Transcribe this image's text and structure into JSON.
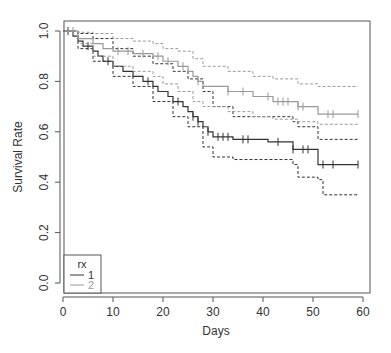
{
  "chart_data": {
    "type": "line",
    "subtype": "kaplan-meier",
    "title": "",
    "xlabel": "Days",
    "ylabel": "Survival Rate",
    "xlim": [
      0,
      60
    ],
    "ylim": [
      0,
      1
    ],
    "xticks": [
      0,
      10,
      20,
      30,
      40,
      50,
      60
    ],
    "xtick_labels": [
      "0",
      "10",
      "20",
      "30",
      "40",
      "50",
      "60"
    ],
    "yticks": [
      0.0,
      0.2,
      0.4,
      0.6,
      0.8,
      1.0
    ],
    "ytick_labels": [
      "0.0",
      "0.2",
      "0.4",
      "0.6",
      "0.8",
      "1.0"
    ],
    "grid": false,
    "legend": {
      "title": "rx",
      "position": "bottom-left",
      "entries": [
        "1",
        "2"
      ]
    },
    "series": [
      {
        "name": "1",
        "color": "#333333",
        "steps": [
          [
            0,
            1.0
          ],
          [
            2,
            0.98
          ],
          [
            3,
            0.96
          ],
          [
            4,
            0.94
          ],
          [
            6,
            0.92
          ],
          [
            7,
            0.9
          ],
          [
            8,
            0.88
          ],
          [
            10,
            0.86
          ],
          [
            12,
            0.84
          ],
          [
            14,
            0.82
          ],
          [
            16,
            0.8
          ],
          [
            18,
            0.78
          ],
          [
            19,
            0.76
          ],
          [
            21,
            0.74
          ],
          [
            22,
            0.72
          ],
          [
            24,
            0.7
          ],
          [
            25,
            0.68
          ],
          [
            26,
            0.66
          ],
          [
            27,
            0.64
          ],
          [
            28,
            0.62
          ],
          [
            29,
            0.6
          ],
          [
            30,
            0.58
          ],
          [
            34,
            0.57
          ],
          [
            41,
            0.56
          ],
          [
            46,
            0.53
          ],
          [
            51,
            0.47
          ],
          [
            59,
            0.47
          ]
        ],
        "censor_x": [
          1,
          5,
          9,
          17,
          23,
          26,
          27,
          29,
          31,
          32,
          33,
          36,
          37,
          43,
          46,
          48,
          49,
          52,
          54,
          59
        ],
        "lower_ci": [
          [
            0,
            1.0
          ],
          [
            3,
            0.93
          ],
          [
            6,
            0.88
          ],
          [
            10,
            0.82
          ],
          [
            14,
            0.78
          ],
          [
            18,
            0.72
          ],
          [
            22,
            0.66
          ],
          [
            25,
            0.62
          ],
          [
            28,
            0.54
          ],
          [
            30,
            0.5
          ],
          [
            34,
            0.49
          ],
          [
            46,
            0.47
          ],
          [
            47,
            0.42
          ],
          [
            51,
            0.41
          ],
          [
            52,
            0.35
          ],
          [
            59,
            0.35
          ]
        ],
        "upper_ci": [
          [
            0,
            1.0
          ],
          [
            3,
            0.99
          ],
          [
            6,
            0.97
          ],
          [
            10,
            0.93
          ],
          [
            14,
            0.9
          ],
          [
            18,
            0.87
          ],
          [
            22,
            0.84
          ],
          [
            25,
            0.81
          ],
          [
            28,
            0.76
          ],
          [
            30,
            0.7
          ],
          [
            34,
            0.66
          ],
          [
            46,
            0.64
          ],
          [
            47,
            0.62
          ],
          [
            51,
            0.57
          ],
          [
            59,
            0.57
          ]
        ]
      },
      {
        "name": "2",
        "color": "#999999",
        "steps": [
          [
            0,
            1.0
          ],
          [
            3,
            0.97
          ],
          [
            6,
            0.95
          ],
          [
            8,
            0.93
          ],
          [
            10,
            0.92
          ],
          [
            14,
            0.91
          ],
          [
            18,
            0.9
          ],
          [
            20,
            0.88
          ],
          [
            23,
            0.86
          ],
          [
            25,
            0.84
          ],
          [
            26,
            0.82
          ],
          [
            27,
            0.8
          ],
          [
            28,
            0.78
          ],
          [
            33,
            0.76
          ],
          [
            38,
            0.74
          ],
          [
            42,
            0.72
          ],
          [
            47,
            0.7
          ],
          [
            51,
            0.67
          ],
          [
            59,
            0.67
          ]
        ],
        "censor_x": [
          1,
          2,
          11,
          13,
          16,
          19,
          21,
          24,
          27,
          33,
          36,
          41,
          43,
          44,
          45,
          47,
          48,
          53,
          54,
          59
        ],
        "lower_ci": [
          [
            0,
            1.0
          ],
          [
            3,
            0.95
          ],
          [
            6,
            0.9
          ],
          [
            10,
            0.86
          ],
          [
            14,
            0.84
          ],
          [
            18,
            0.82
          ],
          [
            20,
            0.79
          ],
          [
            23,
            0.76
          ],
          [
            26,
            0.72
          ],
          [
            28,
            0.7
          ],
          [
            33,
            0.68
          ],
          [
            38,
            0.66
          ],
          [
            42,
            0.65
          ],
          [
            47,
            0.64
          ],
          [
            51,
            0.63
          ],
          [
            59,
            0.63
          ]
        ],
        "upper_ci": [
          [
            0,
            1.0
          ],
          [
            3,
            0.995
          ],
          [
            6,
            0.99
          ],
          [
            10,
            0.97
          ],
          [
            14,
            0.96
          ],
          [
            18,
            0.95
          ],
          [
            20,
            0.93
          ],
          [
            23,
            0.92
          ],
          [
            26,
            0.89
          ],
          [
            28,
            0.86
          ],
          [
            33,
            0.84
          ],
          [
            38,
            0.82
          ],
          [
            42,
            0.81
          ],
          [
            47,
            0.79
          ],
          [
            51,
            0.78
          ],
          [
            59,
            0.78
          ]
        ]
      }
    ]
  }
}
